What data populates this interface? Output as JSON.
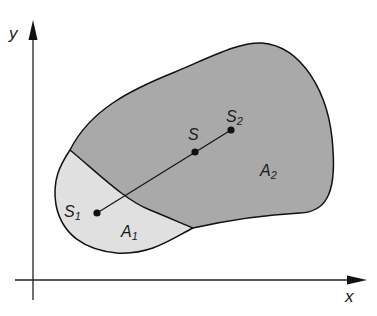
{
  "diagram": {
    "type": "centroid-composite-area",
    "axes": {
      "x_label": "x",
      "y_label": "y"
    },
    "regions": [
      {
        "id": "A1",
        "label": "A",
        "subscript": "1",
        "fill": "#e0e0e0"
      },
      {
        "id": "A2",
        "label": "A",
        "subscript": "2",
        "fill": "#a9a9a9"
      }
    ],
    "points": [
      {
        "id": "S1",
        "label": "S",
        "subscript": "1"
      },
      {
        "id": "S",
        "label": "S",
        "subscript": ""
      },
      {
        "id": "S2",
        "label": "S",
        "subscript": "2"
      }
    ],
    "colors": {
      "outline": "#111111",
      "axis": "#222222",
      "region_A1": "#e0e0e0",
      "region_A2": "#a9a9a9"
    }
  }
}
